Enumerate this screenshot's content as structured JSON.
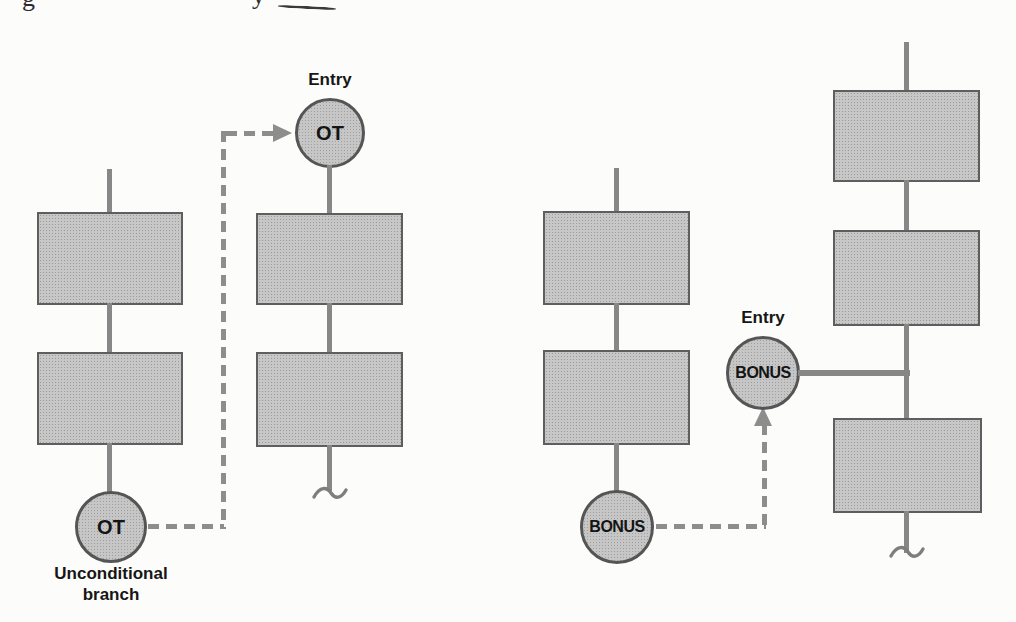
{
  "figure": {
    "type": "flowchart-pair",
    "description_visible_text_only": true
  },
  "fragment": {
    "f1": "g",
    "f2": "y"
  },
  "left": {
    "entry_label": "Entry",
    "entry_node": "OT",
    "source_node": "OT",
    "caption_line1": "Unconditional",
    "caption_line2": "branch"
  },
  "right": {
    "entry_label": "Entry",
    "entry_node": "BONUS",
    "source_node": "BONUS"
  },
  "colors": {
    "shape_fill": "#c7c7c7",
    "shape_border": "#5e5e5e",
    "line": "#878787",
    "dash": "#8d8d8d",
    "text": "#161616",
    "background": "#fcfcfa"
  }
}
